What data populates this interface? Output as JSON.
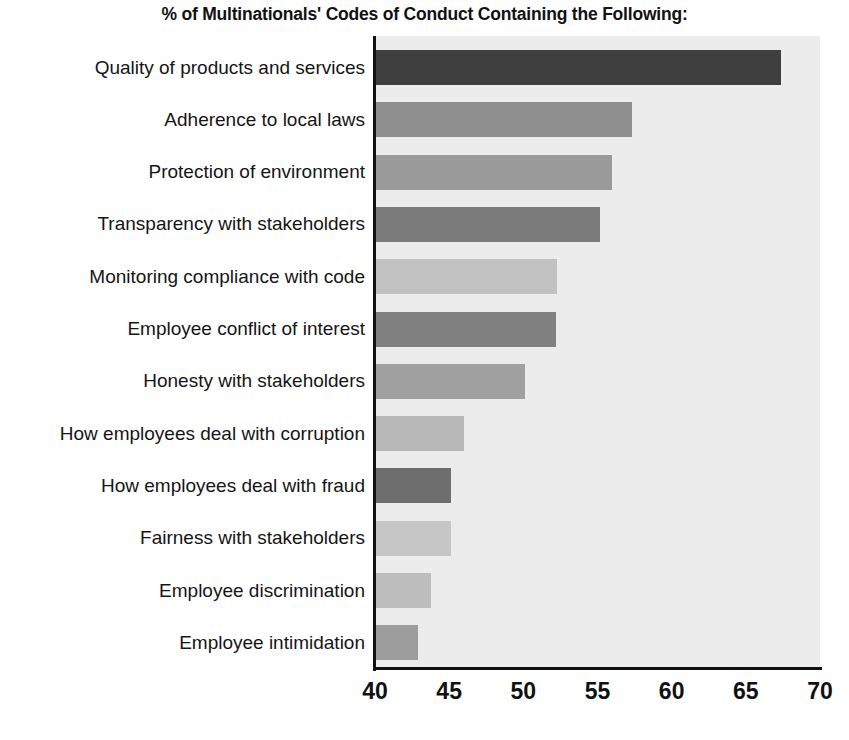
{
  "chart_data": {
    "type": "bar",
    "orientation": "horizontal",
    "title": "% of Multinationals' Codes of Conduct Containing the Following:",
    "xlabel": "",
    "ylabel": "",
    "xlim": [
      40,
      70
    ],
    "xticks": [
      40,
      45,
      50,
      55,
      60,
      65,
      70
    ],
    "grid": false,
    "legend": false,
    "legend_position": "none",
    "plot_background": "#ececec",
    "categories": [
      "Quality of products and services",
      "Adherence to local laws",
      "Protection of environment",
      "Transparency with stakeholders",
      "Monitoring compliance with code",
      "Employee conflict of interest",
      "Honesty with stakeholders",
      "How employees deal with corruption",
      "How employees deal with fraud",
      "Fairness with stakeholders",
      "Employee discrimination",
      "Employee intimidation"
    ],
    "values": [
      67.4,
      57.3,
      56.0,
      55.2,
      52.3,
      52.2,
      50.1,
      46.0,
      45.1,
      45.1,
      43.8,
      42.9
    ],
    "bar_colors": [
      "#3f3f3f",
      "#8f8f8f",
      "#9a9a9a",
      "#7b7b7b",
      "#c2c2c2",
      "#808080",
      "#a0a0a0",
      "#b8b8b8",
      "#6e6e6e",
      "#c6c6c6",
      "#bdbdbd",
      "#9d9d9d"
    ]
  }
}
